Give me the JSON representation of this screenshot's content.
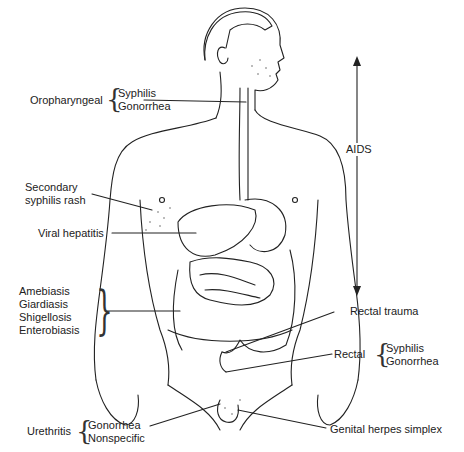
{
  "figure": {
    "type": "anatomical-diagram"
  },
  "labels": {
    "oropharyngeal": {
      "site": "Oropharyngeal",
      "items": [
        "Syphilis",
        "Gonorrhea"
      ]
    },
    "secondary_syphilis": {
      "line1": "Secondary",
      "line2": "syphilis rash"
    },
    "viral_hepatitis": "Viral hepatitis",
    "intestinal": {
      "items": [
        "Amebiasis",
        "Giardiasis",
        "Shigellosis",
        "Enterobiasis"
      ]
    },
    "aids": "AIDS",
    "rectal_trauma": "Rectal trauma",
    "rectal": {
      "site": "Rectal",
      "items": [
        "Syphilis",
        "Gonorrhea"
      ]
    },
    "urethritis": {
      "site": "Urethritis",
      "items": [
        "Gonorrhea",
        "Nonspecific"
      ]
    },
    "genital_herpes": "Genital herpes simplex"
  }
}
